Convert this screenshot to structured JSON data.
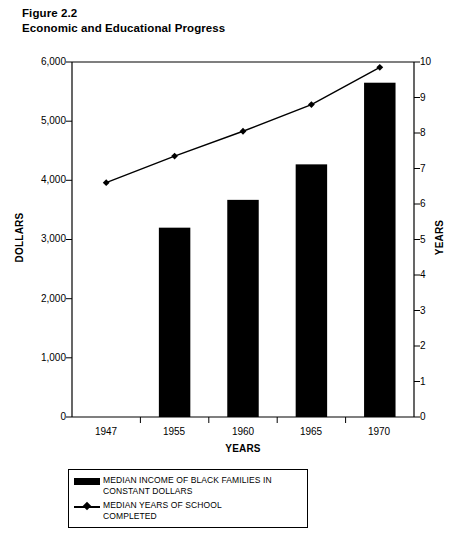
{
  "figure": {
    "number_label": "Figure 2.2",
    "title": "Economic and Educational Progress"
  },
  "chart_data": {
    "type": "bar",
    "title": "Economic and Educational Progress",
    "categories": [
      "1947",
      "1955",
      "1960",
      "1965",
      "1970"
    ],
    "xlabel": "YEARS",
    "ylabel": "DOLLARS",
    "ylabel_secondary": "YEARS",
    "ylim": [
      0,
      6000
    ],
    "ylim_secondary": [
      0,
      10
    ],
    "yticks": [
      "0",
      "1,000",
      "2,000",
      "3,000",
      "4,000",
      "5,000",
      "6,000"
    ],
    "ytick_values": [
      0,
      1000,
      2000,
      3000,
      4000,
      5000,
      6000
    ],
    "yticks_secondary": [
      "0",
      "1",
      "2",
      "3",
      "4",
      "5",
      "6",
      "7",
      "8",
      "9",
      "10"
    ],
    "ytick_values_secondary": [
      0,
      1,
      2,
      3,
      4,
      5,
      6,
      7,
      8,
      9,
      10
    ],
    "grid": false,
    "legend_position": "below-plot",
    "series": [
      {
        "name": "MEDIAN INCOME OF BLACK FAMILIES IN CONSTANT DOLLARS",
        "type": "bar",
        "axis": "left",
        "color": "#000000",
        "values": [
          2420,
          3200,
          3670,
          4270,
          5650
        ]
      },
      {
        "name": "MEDIAN YEARS OF SCHOOL COMPLETED",
        "type": "line",
        "axis": "right",
        "color": "#000000",
        "marker": "diamond",
        "values": [
          6.6,
          7.35,
          8.05,
          8.8,
          9.85
        ]
      }
    ]
  },
  "legend": {
    "items": [
      {
        "key": "bar-swatch",
        "label_line1": "MEDIAN INCOME OF BLACK FAMILIES IN",
        "label_line2": "CONSTANT DOLLARS"
      },
      {
        "key": "line-marker-swatch",
        "label_line1": "MEDIAN YEARS OF SCHOOL",
        "label_line2": "COMPLETED"
      }
    ]
  }
}
